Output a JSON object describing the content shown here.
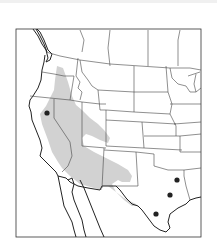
{
  "map": {
    "title": "",
    "region": "Western and Central United States",
    "range_color": "#d2d2d2",
    "point_color": "#222222",
    "distribution_range": {
      "label": "shaded range",
      "description": "From central Oregon south through Nevada, California Central Valley, Utah, Arizona, New Mexico to west Texas"
    },
    "occurrence_points": [
      {
        "id": 1,
        "location": "Northern California",
        "x": 47,
        "y": 113
      },
      {
        "id": 2,
        "location": "East Texas (northeast)",
        "x": 177,
        "y": 180
      },
      {
        "id": 3,
        "location": "East Texas (central)",
        "x": 170,
        "y": 195
      },
      {
        "id": 4,
        "location": "South Texas",
        "x": 156,
        "y": 214
      }
    ]
  }
}
